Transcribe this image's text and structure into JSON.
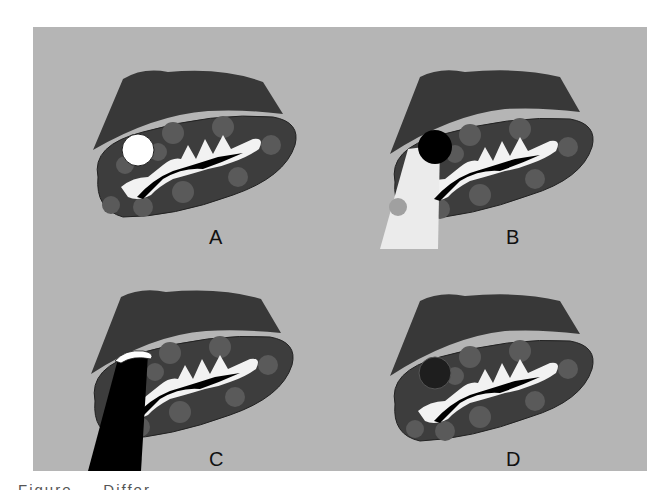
{
  "figure": {
    "panels": [
      {
        "id": "A",
        "label": "A",
        "lesion": "white-nodule",
        "lesion_color": "#ffffff",
        "overlay": "none"
      },
      {
        "id": "B",
        "label": "B",
        "lesion": "black-nodule",
        "lesion_color": "#000000",
        "overlay": "light-beam"
      },
      {
        "id": "C",
        "label": "C",
        "lesion": "white-cap",
        "lesion_color": "#ffffff",
        "overlay": "black-probe"
      },
      {
        "id": "D",
        "label": "D",
        "lesion": "dark-nodule",
        "lesion_color": "#1e1e1e",
        "overlay": "none"
      }
    ],
    "caption": "Figure ... Differ...",
    "colors": {
      "background": "#c9c9c9",
      "organ": "#3d3d3d",
      "spots": "#5a5a5a",
      "sinus": "#f2f2f2",
      "vessel": "#000000",
      "liver_cap": "#383838"
    }
  }
}
